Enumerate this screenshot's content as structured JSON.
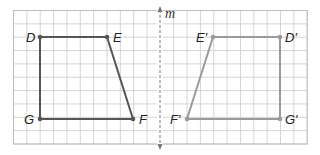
{
  "diagram": {
    "type": "reflection",
    "grid": {
      "x0": 13.5,
      "y0": 10.5,
      "cols": 22,
      "rows": 10,
      "cell": 13.35,
      "line_color": "#d4d4d4",
      "border_color": "#bdbdbd"
    },
    "axis": {
      "label": "m",
      "x": 160,
      "y_top": 6,
      "y_bottom": 150,
      "color": "#777777"
    },
    "original": {
      "color": "#555555",
      "vertices": [
        {
          "name": "D",
          "label": "D",
          "x": 40,
          "y": 37,
          "lx": 26,
          "ly": 42
        },
        {
          "name": "E",
          "label": "E",
          "x": 107,
          "y": 37,
          "lx": 113,
          "ly": 42
        },
        {
          "name": "F",
          "label": "F",
          "x": 133,
          "y": 119,
          "lx": 139,
          "ly": 124
        },
        {
          "name": "G",
          "label": "G",
          "x": 40,
          "y": 119,
          "lx": 24,
          "ly": 124
        }
      ]
    },
    "image": {
      "color": "#9a9a9a",
      "vertices": [
        {
          "name": "D-prime",
          "label": "D′",
          "x": 280,
          "y": 37,
          "lx": 285,
          "ly": 42
        },
        {
          "name": "E-prime",
          "label": "E′",
          "x": 213,
          "y": 37,
          "lx": 196,
          "ly": 42
        },
        {
          "name": "F-prime",
          "label": "F′",
          "x": 187,
          "y": 119,
          "lx": 170,
          "ly": 124
        },
        {
          "name": "G-prime",
          "label": "G′",
          "x": 280,
          "y": 119,
          "lx": 285,
          "ly": 124
        }
      ]
    }
  }
}
